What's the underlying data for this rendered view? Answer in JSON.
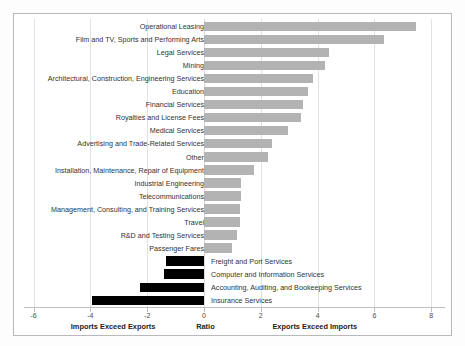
{
  "chart_data": {
    "type": "bar",
    "orientation": "horizontal",
    "title": "",
    "xlabel": "Ratio",
    "ylabel": "",
    "xlim": [
      -6,
      8
    ],
    "xticks": [
      -6,
      -4,
      -2,
      0,
      2,
      4,
      6,
      8
    ],
    "xticklabels": [
      "-6",
      "-4",
      "-2",
      "0",
      "2",
      "4",
      "6",
      "8"
    ],
    "grid": true,
    "legend": null,
    "annotations": [
      {
        "text": "Imports Exceed Exports",
        "x": -3.2
      },
      {
        "text": "Ratio",
        "x": 0.05
      },
      {
        "text": "Exports Exceed Imports",
        "x": 3.9
      }
    ],
    "colors": {
      "positive": "#b3b3b3",
      "negative": "#000000",
      "grid": "#e2e2e2",
      "frame": "#b9b9b9"
    },
    "categories": [
      "Operational Leasing",
      "Film and TV, Sports and Performing Arts",
      "Legal Services",
      "Mining",
      "Architectural, Construction, Engineering Services",
      "Education",
      "Financial Services",
      "Royalties and License Fees",
      "Medical Services",
      "Advertising and Trade-Related Services",
      "Other",
      "Installation, Maintenance, Repair of Equipment",
      "Industrial Engineering",
      "Telecommunications",
      "Management, Consulting, and Training Services",
      "Travel",
      "R&D and Testing Services",
      "Passenger Fares",
      "Freight and Port Services",
      "Computer and Information Services",
      "Accounting, Auditing, and Bookeeping Services",
      "Insurance Services"
    ],
    "values": [
      7.45,
      6.35,
      4.4,
      4.25,
      3.85,
      3.65,
      3.5,
      3.4,
      2.95,
      2.4,
      2.25,
      1.75,
      1.3,
      1.3,
      1.25,
      1.25,
      1.15,
      1.0,
      -1.35,
      -1.4,
      -2.25,
      -3.95
    ],
    "label_placement": [
      "left",
      "left",
      "left",
      "left",
      "left",
      "left",
      "left",
      "left",
      "left",
      "left",
      "left",
      "left",
      "left",
      "left",
      "left",
      "left",
      "left",
      "left",
      "right",
      "right",
      "right",
      "right"
    ]
  }
}
